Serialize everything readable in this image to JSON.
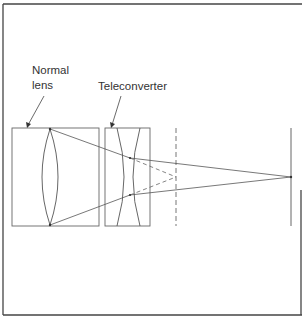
{
  "diagram": {
    "labels": {
      "normal_lens_line1": "Normal",
      "normal_lens_line2": "lens",
      "teleconverter": "Teleconverter"
    },
    "components": [
      {
        "id": "normal-lens",
        "type": "convex-lens",
        "box": {
          "x": 12,
          "y": 128,
          "w": 87,
          "h": 98
        }
      },
      {
        "id": "teleconverter",
        "type": "concave-lens",
        "box": {
          "x": 105,
          "y": 128,
          "w": 45,
          "h": 98
        }
      },
      {
        "id": "original-focal-plane",
        "type": "dashed-plane",
        "x": 176
      },
      {
        "id": "new-focal-plane",
        "type": "image-plane",
        "x": 291
      }
    ],
    "focal_points": {
      "original": {
        "x": 176,
        "y": 177
      },
      "extended": {
        "x": 291,
        "y": 177
      }
    },
    "colors": {
      "line": "#555555",
      "frame": "#444444",
      "text": "#333333",
      "background": "#ffffff"
    }
  }
}
